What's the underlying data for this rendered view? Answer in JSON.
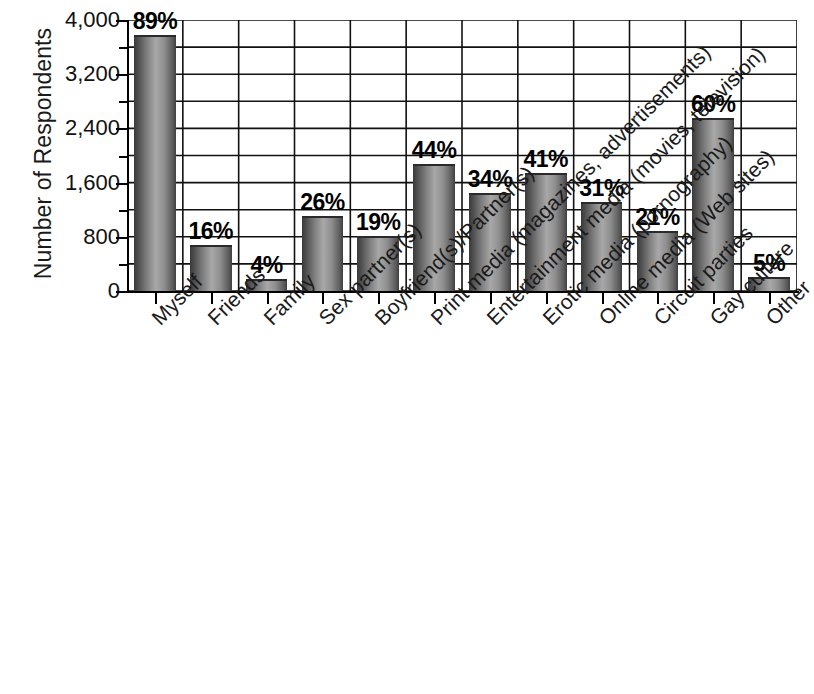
{
  "chart_data": {
    "type": "bar",
    "title": "",
    "subtitle": "",
    "xlabel": "",
    "ylabel": "Number of Respondents",
    "ylim": [
      0,
      4000
    ],
    "y_major_ticks": [
      0,
      800,
      1600,
      2400,
      3200,
      4000
    ],
    "y_major_tick_labels": [
      "0",
      "800",
      "1,600",
      "2,400",
      "3,200",
      "4,000"
    ],
    "y_minor_tick_interval": 400,
    "grid": "horizontal gridlines every 400 units; vertical gridlines at category boundaries",
    "legend": null,
    "orientation": "vertical",
    "bar_style": "grayscale gradient fill, black outline",
    "categories": [
      "Myself",
      "Friends",
      "Family",
      "Sex partner(s)",
      "Boyfriend(s)/Partner(s)",
      "Print media (magazines, advertisements)",
      "Entertainment media (movies, television)",
      "Erotic media (pornography)",
      "Online media (Web sites)",
      "Circuit parties",
      "Gay culture",
      "Other"
    ],
    "values": [
      3780,
      680,
      170,
      1105,
      807,
      1870,
      1445,
      1742,
      1317,
      892,
      2550,
      212
    ],
    "data_labels": [
      "89%",
      "16%",
      "4%",
      "26%",
      "19%",
      "44%",
      "34%",
      "41%",
      "31%",
      "21%",
      "60%",
      "5%"
    ],
    "percentages": [
      89,
      16,
      4,
      26,
      19,
      44,
      34,
      41,
      31,
      21,
      60,
      5
    ]
  },
  "axis": {
    "y_title": "Number of Respondents"
  }
}
